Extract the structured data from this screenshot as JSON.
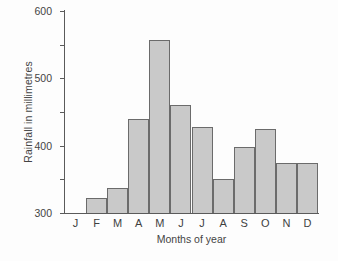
{
  "chart_data": {
    "type": "bar",
    "title": "",
    "xlabel": "Months of year",
    "ylabel": "Rainfall in millimetres",
    "categories": [
      "J",
      "F",
      "M",
      "A",
      "M",
      "J",
      "J",
      "A",
      "S",
      "O",
      "N",
      "D"
    ],
    "values": [
      0,
      45,
      75,
      280,
      515,
      320,
      255,
      100,
      195,
      250,
      150,
      150
    ],
    "ylim": [
      0,
      600
    ],
    "yticks": [
      0,
      100,
      200,
      300,
      400,
      500,
      600
    ],
    "ytick_labels": [
      "0",
      "100",
      "200",
      "300",
      "400",
      "500",
      "600"
    ],
    "grid": false,
    "legend": null,
    "bar_fill_color": "#c9c9c9",
    "bar_edge_color": "#6b6b6b",
    "axis_color": "#5a5a5a",
    "background_color": "#fdfdfd"
  }
}
